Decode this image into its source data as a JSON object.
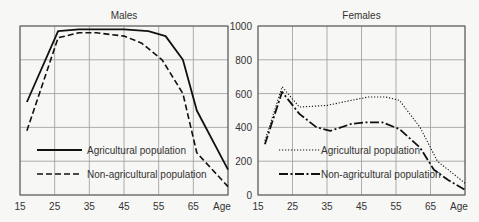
{
  "chart_data": [
    {
      "type": "line",
      "title": "Males",
      "xlabel": "Age",
      "ylabel": "",
      "xlim": [
        15,
        75
      ],
      "ylim": [
        0,
        1000
      ],
      "x_ticks": [
        "15",
        "25",
        "35",
        "45",
        "55",
        "65",
        "Age"
      ],
      "y_ticks": [
        0,
        200,
        400,
        600,
        800,
        1000
      ],
      "grid": true,
      "series": [
        {
          "name": "Agricultural population",
          "style": "solid",
          "x": [
            17,
            26,
            32,
            45,
            52,
            57,
            62,
            66,
            75
          ],
          "values": [
            550,
            970,
            980,
            980,
            970,
            940,
            800,
            500,
            150
          ]
        },
        {
          "name": "Non-agricultural population",
          "style": "dashed",
          "x": [
            17,
            26,
            32,
            37,
            45,
            50,
            56,
            62,
            66,
            75
          ],
          "values": [
            380,
            930,
            960,
            960,
            940,
            900,
            800,
            600,
            250,
            50
          ]
        }
      ]
    },
    {
      "type": "line",
      "title": "Females",
      "xlabel": "Age",
      "ylabel": "",
      "xlim": [
        15,
        75
      ],
      "ylim": [
        0,
        1000
      ],
      "x_ticks": [
        "15",
        "25",
        "35",
        "45",
        "55",
        "65",
        "Age"
      ],
      "y_ticks": [
        0,
        200,
        400,
        600,
        800,
        1000
      ],
      "grid": true,
      "series": [
        {
          "name": "Agricultural population",
          "style": "dotted",
          "x": [
            17,
            22,
            27,
            35,
            42,
            47,
            52,
            56,
            62,
            67,
            75
          ],
          "values": [
            320,
            640,
            520,
            530,
            560,
            580,
            580,
            560,
            400,
            200,
            70
          ]
        },
        {
          "name": "Non-agricultural population",
          "style": "dash-dot",
          "x": [
            17,
            22,
            27,
            32,
            36,
            42,
            46,
            51,
            56,
            62,
            66,
            70,
            75
          ],
          "values": [
            300,
            610,
            480,
            400,
            380,
            420,
            430,
            430,
            390,
            280,
            150,
            90,
            30
          ]
        }
      ]
    }
  ],
  "shared_axis": {
    "y_ticks_labels": [
      "0",
      "200",
      "400",
      "600",
      "800",
      "1000"
    ]
  }
}
